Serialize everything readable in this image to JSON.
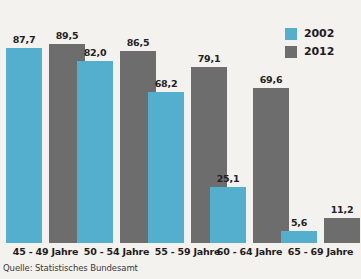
{
  "chart_data": {
    "type": "bar",
    "title": "",
    "subtitle": "",
    "xlabel": "",
    "ylabel": "",
    "ylim": [
      0,
      100
    ],
    "grid": false,
    "legend_position": "top-right",
    "categories": [
      "45 - 49 Jahre",
      "50 - 54 Jahre",
      "55 - 59 Jahre",
      "60 - 64 Jahre",
      "65 - 69 Jahre"
    ],
    "series": [
      {
        "name": "2002",
        "color": "#54aecd",
        "values": [
          87.7,
          82.0,
          68.2,
          25.1,
          5.6
        ],
        "labels": [
          "87,7",
          "82,0",
          "68,2",
          "25,1",
          "5,6"
        ]
      },
      {
        "name": "2012",
        "color": "#6d6d6d",
        "values": [
          89.5,
          86.5,
          79.1,
          69.6,
          11.2
        ],
        "labels": [
          "89,5",
          "86,5",
          "79,1",
          "69,6",
          "11,2"
        ]
      }
    ],
    "source": "Quelle: Statistisches Bundesamt"
  },
  "legend": {
    "entries": [
      {
        "label": "2002",
        "color": "#54aecd"
      },
      {
        "label": "2012",
        "color": "#6d6d6d"
      }
    ]
  },
  "colors": {
    "background": "#f4f2ef",
    "series_2002": "#54aecd",
    "series_2012": "#6d6d6d",
    "text": "#1f1c1b"
  }
}
